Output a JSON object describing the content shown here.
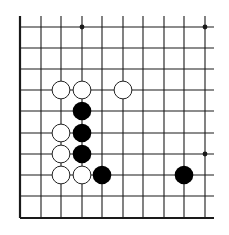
{
  "diagram": {
    "type": "go-board-fragment",
    "grid": {
      "columns": 10,
      "rows": 10,
      "x_positions": [
        20,
        41,
        61,
        82,
        102,
        123,
        143,
        164,
        184,
        205
      ],
      "y_positions": [
        27,
        48,
        69,
        90,
        111,
        133,
        154,
        175,
        196,
        218
      ],
      "thick_edges": [
        "left",
        "bottom"
      ],
      "line_color": "#1a1a1a"
    },
    "star_points": [
      {
        "col": 3,
        "row": 0
      },
      {
        "col": 9,
        "row": 0
      },
      {
        "col": 9,
        "row": 6
      }
    ],
    "stones": [
      {
        "color": "white",
        "col": 2,
        "row": 3
      },
      {
        "color": "white",
        "col": 3,
        "row": 3
      },
      {
        "color": "white",
        "col": 5,
        "row": 3
      },
      {
        "color": "black",
        "col": 3,
        "row": 4
      },
      {
        "color": "white",
        "col": 2,
        "row": 5
      },
      {
        "color": "black",
        "col": 3,
        "row": 5
      },
      {
        "color": "white",
        "col": 2,
        "row": 6
      },
      {
        "color": "black",
        "col": 3,
        "row": 6
      },
      {
        "color": "white",
        "col": 2,
        "row": 7
      },
      {
        "color": "white",
        "col": 3,
        "row": 7
      },
      {
        "color": "black",
        "col": 4,
        "row": 7
      },
      {
        "color": "black",
        "col": 8,
        "row": 7
      }
    ],
    "colors": {
      "black_stone": "#000000",
      "white_stone_fill": "#ffffff",
      "white_stone_stroke": "#222222",
      "background": "#ffffff"
    }
  }
}
